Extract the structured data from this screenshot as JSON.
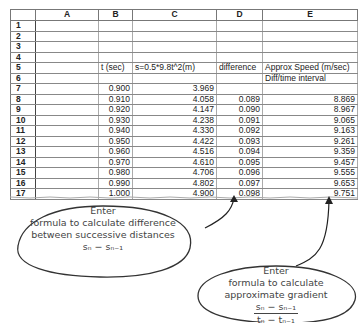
{
  "spreadsheet": {
    "columns": [
      "A",
      "B",
      "C",
      "D",
      "E"
    ],
    "row_numbers": [
      "1",
      "2",
      "3",
      "4",
      "5",
      "6",
      "7",
      "8",
      "9",
      "10",
      "11",
      "12",
      "13",
      "14",
      "15",
      "16",
      "17"
    ],
    "rows": [
      {
        "A": "",
        "B": "",
        "C": "",
        "D": "",
        "E": ""
      },
      {
        "A": "",
        "B": "",
        "C": "",
        "D": "",
        "E": ""
      },
      {
        "A": "",
        "B": "",
        "C": "",
        "D": "",
        "E": ""
      },
      {
        "A": "",
        "B": "",
        "C": "",
        "D": "",
        "E": ""
      },
      {
        "A": "",
        "B": "t (sec)",
        "C": "s=0.5*9.8t^2(m)",
        "D": "difference",
        "E": "Approx Speed (m/sec)"
      },
      {
        "A": "",
        "B": "",
        "C": "",
        "D": "",
        "E": "Diff/time interval"
      },
      {
        "A": "",
        "B": "0.900",
        "C": "3.969",
        "D": "",
        "E": ""
      },
      {
        "A": "",
        "B": "0.910",
        "C": "4.058",
        "D": "0.089",
        "E": "8.869"
      },
      {
        "A": "",
        "B": "0.920",
        "C": "4.147",
        "D": "0.090",
        "E": "8.967"
      },
      {
        "A": "",
        "B": "0.930",
        "C": "4.238",
        "D": "0.091",
        "E": "9.065"
      },
      {
        "A": "",
        "B": "0.940",
        "C": "4.330",
        "D": "0.092",
        "E": "9.163"
      },
      {
        "A": "",
        "B": "0.950",
        "C": "4.422",
        "D": "0.093",
        "E": "9.261"
      },
      {
        "A": "",
        "B": "0.960",
        "C": "4.516",
        "D": "0.094",
        "E": "9.359"
      },
      {
        "A": "",
        "B": "0.970",
        "C": "4.610",
        "D": "0.095",
        "E": "9.457"
      },
      {
        "A": "",
        "B": "0.980",
        "C": "4.706",
        "D": "0.096",
        "E": "9.555"
      },
      {
        "A": "",
        "B": "0.990",
        "C": "4.802",
        "D": "0.097",
        "E": "9.653"
      },
      {
        "A": "",
        "B": "1.000",
        "C": "4.900",
        "D": "0.098",
        "E": "9.751"
      }
    ]
  },
  "callouts": {
    "difference": {
      "line1": "Enter",
      "line2": "formula to calculate difference",
      "line3": "between successive distances",
      "formula": "sₙ − sₙ₋₁"
    },
    "gradient": {
      "line1": "Enter",
      "line2": "formula to calculate",
      "line3": "approximate gradient",
      "numerator": "sₙ − sₙ₋₁",
      "denominator": "tₙ − tₙ₋₁"
    }
  }
}
